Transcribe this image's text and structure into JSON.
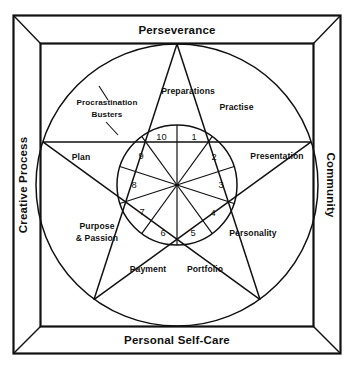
{
  "diagram": {
    "frame_labels": {
      "top": "Perseverance",
      "bottom": "Personal Self-Care",
      "left": "Creative Process",
      "right": "Community"
    },
    "ring_segments": [
      {
        "id": "preparations",
        "label": "Preparations",
        "lines": [
          "Preparations"
        ]
      },
      {
        "id": "practise",
        "label": "Practise",
        "lines": [
          "Practise"
        ]
      },
      {
        "id": "presentation",
        "label": "Presentation",
        "lines": [
          "Presentation"
        ]
      },
      {
        "id": "personality",
        "label": "Personality",
        "lines": [
          "Personality"
        ]
      },
      {
        "id": "portfolio",
        "label": "Portfolio",
        "lines": [
          "Portfolio"
        ]
      },
      {
        "id": "payment",
        "label": "Payment",
        "lines": [
          "Payment"
        ]
      },
      {
        "id": "purpose-and-passion",
        "label": "Purpose & Passion",
        "lines": [
          "Purpose",
          "& Passion"
        ]
      },
      {
        "id": "plan",
        "label": "Plan",
        "lines": [
          "Plan"
        ]
      },
      {
        "id": "procrastination-busters",
        "label": "Procrastination Busters",
        "lines": [
          "Procrastination",
          "Busters"
        ]
      }
    ],
    "inner_numbers": [
      "1",
      "2",
      "3",
      "4",
      "5",
      "6",
      "7",
      "8",
      "9",
      "10"
    ],
    "colors": {
      "ink": "#111111",
      "paper": "#ffffff"
    }
  }
}
